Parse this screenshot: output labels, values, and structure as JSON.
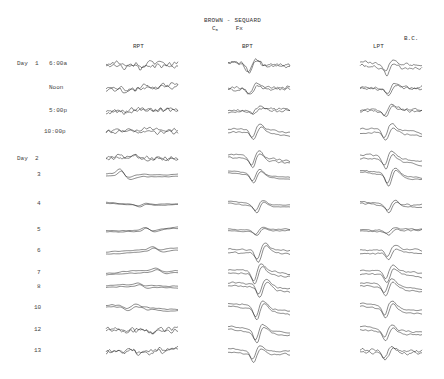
{
  "figure": {
    "title": "BROWN - SEQUARD",
    "level": "C",
    "level_subscript": "5",
    "injury": "Fx",
    "patient_initials": "B.C."
  },
  "columns": [
    {
      "label": "RPT",
      "x": 106,
      "width": 72,
      "label_x": 133
    },
    {
      "label": "BPT",
      "x": 228,
      "width": 62,
      "label_x": 242
    },
    {
      "label": "LPT",
      "x": 360,
      "width": 62,
      "label_x": 373
    }
  ],
  "rows": [
    {
      "day": "Day  1",
      "time": "6:00a",
      "y": 63,
      "time_x": 49
    },
    {
      "day": "",
      "time": "Noon",
      "y": 87,
      "time_x": 49
    },
    {
      "day": "",
      "time": "5:00p",
      "y": 110,
      "time_x": 49
    },
    {
      "day": "",
      "time": "10:00p",
      "y": 131,
      "time_x": 44
    },
    {
      "day": "Day  2",
      "time": "",
      "y": 158,
      "time_x": 49
    },
    {
      "day": "",
      "time": "3",
      "y": 174,
      "time_x": 37
    },
    {
      "day": "",
      "time": "4",
      "y": 203,
      "time_x": 37
    },
    {
      "day": "",
      "time": "5",
      "y": 229,
      "time_x": 37
    },
    {
      "day": "",
      "time": "6",
      "y": 250,
      "time_x": 37
    },
    {
      "day": "",
      "time": "7",
      "y": 272,
      "time_x": 37
    },
    {
      "day": "",
      "time": "8",
      "y": 286,
      "time_x": 37
    },
    {
      "day": "",
      "time": "10",
      "y": 307,
      "time_x": 34
    },
    {
      "day": "",
      "time": "12",
      "y": 329,
      "time_x": 34
    },
    {
      "day": "",
      "time": "13",
      "y": 350,
      "time_x": 34
    }
  ],
  "trace_style": {
    "RPT": [
      {
        "noise": 2.6,
        "smooth": 1,
        "dip": 3,
        "dip_pos": 0.5,
        "sep": 2.5
      },
      {
        "noise": 2.2,
        "smooth": 1,
        "dip": -3,
        "dip_pos": 0.55,
        "sep": 1.2
      },
      {
        "noise": 2.2,
        "smooth": 1,
        "dip": 0,
        "dip_pos": 0.5,
        "sep": 1.0
      },
      {
        "noise": 2.0,
        "smooth": 1,
        "dip": -2,
        "dip_pos": 0.6,
        "sep": 1.2
      },
      {
        "noise": 2.0,
        "smooth": 1,
        "dip": -2,
        "dip_pos": 0.4,
        "sep": 1.0
      },
      {
        "noise": 0.5,
        "smooth": 4,
        "dip": -6,
        "dip_pos": 0.2,
        "sep": 2.0
      },
      {
        "noise": 0.5,
        "smooth": 4,
        "dip": 2,
        "dip_pos": 0.45,
        "sep": 0.8
      },
      {
        "noise": 0.5,
        "smooth": 4,
        "dip": -3,
        "dip_pos": 0.55,
        "sep": 1.0
      },
      {
        "noise": 0.5,
        "smooth": 4,
        "dip": -3,
        "dip_pos": 0.65,
        "sep": 2.0
      },
      {
        "noise": 0.6,
        "smooth": 4,
        "dip": -3,
        "dip_pos": 0.7,
        "sep": 1.8
      },
      {
        "noise": 0.6,
        "smooth": 4,
        "dip": -2,
        "dip_pos": 0.45,
        "sep": 1.8
      },
      {
        "noise": 0.8,
        "smooth": 3,
        "dip": 3,
        "dip_pos": 0.3,
        "sep": 2.0
      },
      {
        "noise": 2.2,
        "smooth": 1,
        "dip": -2,
        "dip_pos": 0.5,
        "sep": 0.8
      },
      {
        "noise": 2.4,
        "smooth": 1,
        "dip": -3,
        "dip_pos": 0.35,
        "sep": 0.8
      }
    ],
    "BPT": [
      {
        "noise": 1.6,
        "smooth": 1,
        "dip": 9,
        "dip_pos": 0.33,
        "sep": 1.5
      },
      {
        "noise": 1.4,
        "smooth": 1,
        "dip": 7,
        "dip_pos": 0.35,
        "sep": 2.0
      },
      {
        "noise": 1.2,
        "smooth": 1,
        "dip": 4,
        "dip_pos": 0.4,
        "sep": 1.5
      },
      {
        "noise": 0.8,
        "smooth": 2,
        "dip": 10,
        "dip_pos": 0.4,
        "sep": 3.0
      },
      {
        "noise": 1.0,
        "smooth": 2,
        "dip": 11,
        "dip_pos": 0.38,
        "sep": 2.5
      },
      {
        "noise": 0.5,
        "smooth": 3,
        "dip": 9,
        "dip_pos": 0.4,
        "sep": 2.0
      },
      {
        "noise": 0.5,
        "smooth": 3,
        "dip": 8,
        "dip_pos": 0.45,
        "sep": 2.0
      },
      {
        "noise": 0.5,
        "smooth": 3,
        "dip": 5,
        "dip_pos": 0.45,
        "sep": 1.5
      },
      {
        "noise": 0.8,
        "smooth": 2,
        "dip": 12,
        "dip_pos": 0.48,
        "sep": 3.0
      },
      {
        "noise": 0.8,
        "smooth": 2,
        "dip": 13,
        "dip_pos": 0.42,
        "sep": 3.0
      },
      {
        "noise": 0.8,
        "smooth": 2,
        "dip": 12,
        "dip_pos": 0.5,
        "sep": 3.0
      },
      {
        "noise": 0.8,
        "smooth": 2,
        "dip": 13,
        "dip_pos": 0.45,
        "sep": 3.0
      },
      {
        "noise": 0.8,
        "smooth": 2,
        "dip": 12,
        "dip_pos": 0.45,
        "sep": 3.0
      },
      {
        "noise": 0.9,
        "smooth": 2,
        "dip": 10,
        "dip_pos": 0.4,
        "sep": 3.0
      }
    ],
    "LPT": [
      {
        "noise": 1.4,
        "smooth": 1,
        "dip": 8,
        "dip_pos": 0.42,
        "sep": 4.0
      },
      {
        "noise": 1.2,
        "smooth": 1,
        "dip": 7,
        "dip_pos": 0.45,
        "sep": 1.5
      },
      {
        "noise": 1.2,
        "smooth": 1,
        "dip": 8,
        "dip_pos": 0.4,
        "sep": 1.5
      },
      {
        "noise": 1.0,
        "smooth": 2,
        "dip": 10,
        "dip_pos": 0.4,
        "sep": 3.5
      },
      {
        "noise": 1.0,
        "smooth": 2,
        "dip": 11,
        "dip_pos": 0.4,
        "sep": 3.5
      },
      {
        "noise": 0.8,
        "smooth": 2,
        "dip": 12,
        "dip_pos": 0.45,
        "sep": 2.0
      },
      {
        "noise": 0.8,
        "smooth": 2,
        "dip": 8,
        "dip_pos": 0.45,
        "sep": 2.0
      },
      {
        "noise": 0.7,
        "smooth": 2,
        "dip": 4,
        "dip_pos": 0.45,
        "sep": 1.5
      },
      {
        "noise": 0.8,
        "smooth": 2,
        "dip": 8,
        "dip_pos": 0.45,
        "sep": 3.5
      },
      {
        "noise": 0.8,
        "smooth": 2,
        "dip": 10,
        "dip_pos": 0.42,
        "sep": 3.5
      },
      {
        "noise": 0.8,
        "smooth": 2,
        "dip": 11,
        "dip_pos": 0.4,
        "sep": 3.0
      },
      {
        "noise": 0.8,
        "smooth": 2,
        "dip": 11,
        "dip_pos": 0.4,
        "sep": 3.0
      },
      {
        "noise": 0.8,
        "smooth": 2,
        "dip": 10,
        "dip_pos": 0.4,
        "sep": 3.0
      },
      {
        "noise": 1.2,
        "smooth": 1,
        "dip": 8,
        "dip_pos": 0.4,
        "sep": 2.0
      }
    ]
  }
}
